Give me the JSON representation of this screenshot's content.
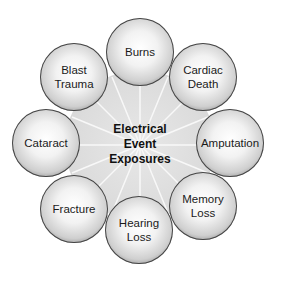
{
  "center": {
    "line1": "Electrical",
    "line2": "Event",
    "line3": "Exposures"
  },
  "nodes": [
    {
      "label1": "Burns",
      "label2": ""
    },
    {
      "label1": "Cardiac",
      "label2": "Death"
    },
    {
      "label1": "Amputation",
      "label2": ""
    },
    {
      "label1": "Memory",
      "label2": "Loss"
    },
    {
      "label1": "Hearing",
      "label2": "Loss"
    },
    {
      "label1": "Fracture",
      "label2": ""
    },
    {
      "label1": "Cataract",
      "label2": ""
    },
    {
      "label1": "Blast",
      "label2": "Trauma"
    }
  ]
}
